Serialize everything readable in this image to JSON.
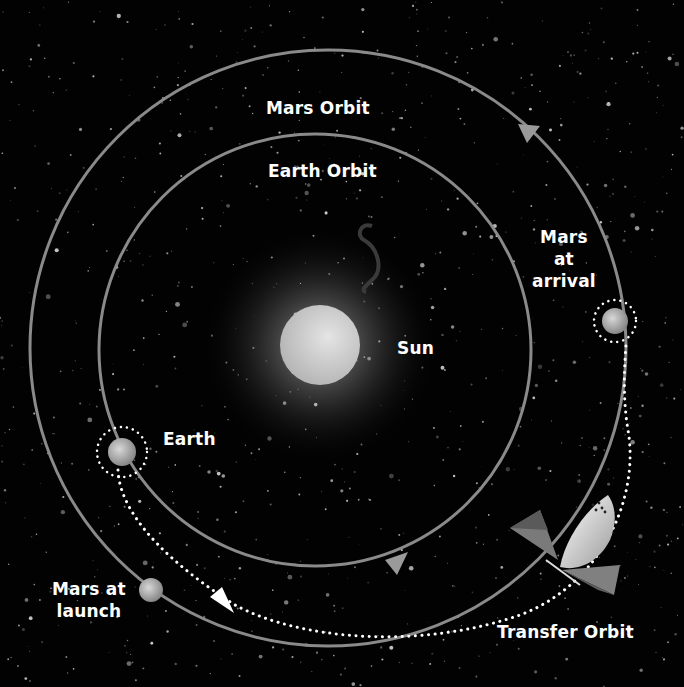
{
  "labels": {
    "mars_orbit": "Mars Orbit",
    "earth_orbit": "Earth Orbit",
    "sun": "Sun",
    "earth": "Earth",
    "mars_arrival_line1": "Mars",
    "mars_arrival_line2": "at",
    "mars_arrival_line3": "arrival",
    "mars_launch_line1": "Mars at",
    "mars_launch_line2": "launch",
    "transfer_orbit": "Transfer Orbit"
  },
  "colors": {
    "background": "#020202",
    "orbit_line": "#8a8a8a",
    "transfer_dots": "#ffffff",
    "sun": "#c8c8c8",
    "text": "#ffffff"
  },
  "geometry": {
    "sun": {
      "cx": 320,
      "cy": 345,
      "r": 40
    },
    "earth_orbit": {
      "cx": 315,
      "cy": 350,
      "r": 216
    },
    "mars_orbit": {
      "cx": 328,
      "cy": 348,
      "r": 298
    },
    "earth": {
      "cx": 122,
      "cy": 450,
      "r": 14
    },
    "mars_launch": {
      "cx": 151,
      "cy": 590,
      "r": 12
    },
    "mars_arrival": {
      "cx": 614,
      "cy": 320,
      "r": 13
    }
  }
}
